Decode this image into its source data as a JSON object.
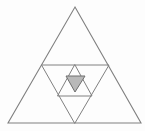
{
  "figure": {
    "canvas": {
      "width": 145,
      "height": 131
    },
    "colors": {
      "background": "#fdfdfd",
      "stroke": "#808080",
      "stroke_dark": "#6e6e6e",
      "shaded_fill": "#b9b9b9"
    },
    "stroke_widths": {
      "outer": 1.1,
      "inner": 1.0,
      "innermost": 1.0
    },
    "levels": [
      {
        "name": "outer-triangle",
        "orientation": "up",
        "points": "75,7 141,123 8,123",
        "label": "Level 0 outer triangle"
      },
      {
        "name": "midline-triangle",
        "orientation": "down",
        "points": "42,65 109,65 75,123",
        "label": "Level 1 inverted middle triangle"
      },
      {
        "name": "medium-triangle",
        "orientation": "up",
        "points": "75,65 92,96 58,96",
        "label": "Level 2 upward triangle"
      },
      {
        "name": "shaded-triangle",
        "orientation": "down",
        "points": "66,76 85,76 75,92",
        "label": "Level 3 shaded inverted triangle"
      }
    ],
    "segments": [
      {
        "name": "outer-left-edge",
        "x1": 75,
        "y1": 7,
        "x2": 8,
        "y2": 123
      },
      {
        "name": "outer-right-edge",
        "x1": 75,
        "y1": 7,
        "x2": 141,
        "y2": 123
      },
      {
        "name": "outer-base-edge",
        "x1": 8,
        "y1": 123,
        "x2": 141,
        "y2": 123
      },
      {
        "name": "horizontal-midline",
        "x1": 42,
        "y1": 65,
        "x2": 109,
        "y2": 65
      },
      {
        "name": "median-left-to-base",
        "x1": 42,
        "y1": 65,
        "x2": 75,
        "y2": 123
      },
      {
        "name": "median-right-to-base",
        "x1": 109,
        "y1": 65,
        "x2": 75,
        "y2": 123
      },
      {
        "name": "medium-left-edge",
        "x1": 75,
        "y1": 65,
        "x2": 58,
        "y2": 96
      },
      {
        "name": "medium-right-edge",
        "x1": 75,
        "y1": 65,
        "x2": 92,
        "y2": 96
      },
      {
        "name": "medium-base-edge",
        "x1": 58,
        "y1": 96,
        "x2": 92,
        "y2": 96
      },
      {
        "name": "shaded-left-edge",
        "x1": 66,
        "y1": 76,
        "x2": 75,
        "y2": 92
      },
      {
        "name": "shaded-right-edge",
        "x1": 85,
        "y1": 76,
        "x2": 75,
        "y2": 92
      },
      {
        "name": "shaded-top-edge",
        "x1": 66,
        "y1": 76,
        "x2": 85,
        "y2": 76
      }
    ],
    "counts": {
      "triangle_levels": 4,
      "shaded_regions": 1
    }
  }
}
